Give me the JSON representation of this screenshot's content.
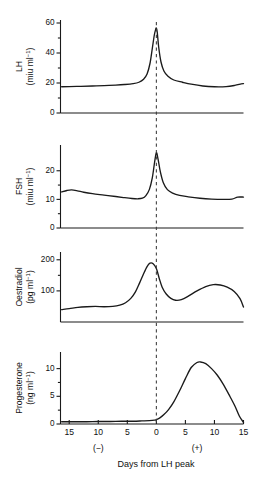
{
  "figure": {
    "title": "",
    "x_axis": {
      "title": "Days from LH peak",
      "tick_labels": [
        "15",
        "10",
        "5",
        "0",
        "5",
        "10",
        "15"
      ],
      "tick_values": [
        -15,
        -10,
        -5,
        0,
        5,
        10,
        15
      ],
      "range": [
        -16.5,
        15
      ],
      "left_sign": "(−)",
      "right_sign": "(+)",
      "left_sign_at": -10,
      "right_sign_at": 7
    },
    "reference_line": {
      "label": "LH peak",
      "x": 0,
      "style": "dashed"
    }
  },
  "chart_data": [
    {
      "type": "line",
      "panel": 1,
      "name": "LH",
      "ylabel": "LH",
      "yunit": "(miu ml",
      "yunit_sup": "−1",
      "yunit_end": ")",
      "ylim": [
        0,
        62
      ],
      "yticks": [
        0,
        20,
        40,
        60
      ],
      "ytick_labels": [
        "0",
        "20",
        "40",
        "60"
      ],
      "xlabel": "",
      "grid": false,
      "legend": "none",
      "x": [
        -16.3,
        -15,
        -13,
        -11,
        -9,
        -7,
        -5.5,
        -4,
        -3,
        -2.2,
        -1.6,
        -1.1,
        -0.7,
        -0.35,
        -0.1,
        0,
        0.15,
        0.4,
        0.8,
        1.3,
        2,
        3,
        4.5,
        6,
        8,
        10,
        12,
        13.5,
        14.6,
        15
      ],
      "y": [
        17.5,
        17.6,
        17.8,
        18.0,
        18.2,
        18.6,
        19.0,
        19.6,
        20.5,
        22.5,
        26.0,
        33.0,
        43.0,
        52.0,
        56.0,
        56.5,
        54.0,
        44.0,
        34.0,
        28.0,
        24.5,
        22.0,
        20.5,
        19.2,
        18.0,
        17.5,
        17.6,
        18.4,
        19.4,
        19.6
      ]
    },
    {
      "type": "line",
      "panel": 2,
      "name": "FSH",
      "ylabel": "FSH",
      "yunit": "(miu ml",
      "yunit_sup": "−1",
      "yunit_end": ")",
      "ylim": [
        0,
        29
      ],
      "yticks": [
        0,
        10,
        20
      ],
      "ytick_labels": [
        "0",
        "10",
        "20"
      ],
      "xlabel": "",
      "grid": false,
      "legend": "none",
      "x": [
        -16.3,
        -15.4,
        -14.6,
        -13.6,
        -12.5,
        -11,
        -9,
        -7,
        -5.5,
        -4.2,
        -3.2,
        -2.4,
        -1.8,
        -1.2,
        -0.7,
        -0.3,
        0,
        0.3,
        0.7,
        1.2,
        1.9,
        2.8,
        4,
        5.5,
        7.5,
        9.5,
        11.5,
        13,
        14,
        15
      ],
      "y": [
        12.6,
        13.1,
        13.3,
        13.0,
        12.5,
        12.0,
        11.5,
        11.0,
        10.6,
        10.3,
        10.2,
        10.4,
        11.3,
        13.5,
        17.5,
        23.0,
        26.3,
        24.0,
        19.5,
        15.8,
        13.4,
        12.2,
        11.4,
        10.9,
        10.4,
        10.1,
        10.0,
        10.1,
        10.8,
        10.8
      ]
    },
    {
      "type": "line",
      "panel": 3,
      "name": "Oestradiol",
      "ylabel": "Oestradiol",
      "yunit": "(pg ml",
      "yunit_sup": "−1",
      "yunit_end": ")",
      "ylim": [
        0,
        225
      ],
      "yticks": [
        100,
        200
      ],
      "ytick_labels": [
        "100",
        "200"
      ],
      "xlabel": "",
      "grid": false,
      "legend": "none",
      "x": [
        -16.3,
        -15,
        -13.5,
        -12,
        -10.5,
        -9,
        -7.5,
        -6.3,
        -5.3,
        -4.4,
        -3.6,
        -2.9,
        -2.2,
        -1.6,
        -1.1,
        -0.6,
        0,
        0.5,
        1,
        1.7,
        2.5,
        3.3,
        4.3,
        5.5,
        7,
        8.5,
        9.8,
        11,
        12.2,
        13.4,
        14.4,
        15
      ],
      "y": [
        40,
        43,
        47,
        49,
        50,
        49,
        50,
        54,
        62,
        76,
        97,
        125,
        155,
        178,
        189,
        188,
        172,
        140,
        112,
        90,
        76,
        70,
        72,
        83,
        100,
        114,
        120,
        119,
        112,
        98,
        75,
        48
      ]
    },
    {
      "type": "line",
      "panel": 4,
      "name": "Progesterone",
      "ylabel": "Progesterone",
      "yunit": "(ng ml",
      "yunit_sup": "−1",
      "yunit_end": ")",
      "ylim": [
        0,
        13
      ],
      "yticks": [
        0,
        5,
        10
      ],
      "ytick_labels": [
        "0",
        "5",
        "10"
      ],
      "xlabel": "Days from LH peak",
      "grid": false,
      "legend": "none",
      "x": [
        -16.3,
        -14,
        -12,
        -10,
        -8,
        -6,
        -4,
        -2.5,
        -1.2,
        -0.3,
        0,
        0.6,
        1.3,
        2.1,
        3,
        4,
        5,
        6,
        7,
        7.6,
        8.5,
        9.5,
        10.5,
        11.5,
        12.5,
        13.5,
        14.3,
        15
      ],
      "y": [
        0.4,
        0.4,
        0.4,
        0.45,
        0.45,
        0.5,
        0.5,
        0.55,
        0.6,
        0.7,
        0.8,
        1.1,
        1.7,
        2.6,
        4.0,
        6.0,
        8.2,
        10.2,
        11.1,
        11.2,
        10.9,
        10.0,
        8.8,
        7.2,
        5.3,
        3.3,
        1.4,
        0.3
      ]
    }
  ]
}
